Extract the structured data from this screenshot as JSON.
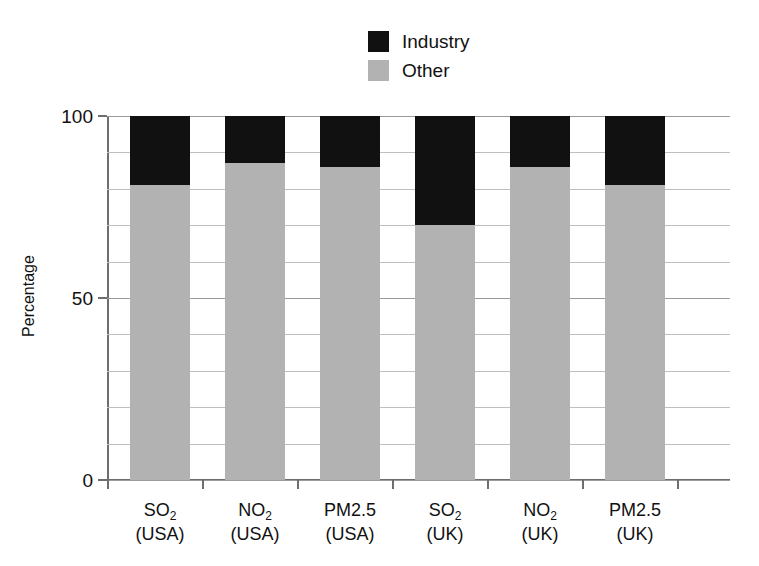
{
  "chart_data": {
    "type": "bar",
    "subtype": "stacked-100-percent",
    "title": "",
    "xlabel": "",
    "ylabel": "Percentage",
    "ylim": [
      0,
      100
    ],
    "yticks": [
      0,
      50,
      100
    ],
    "ytick_labels": [
      "0",
      "50",
      "100"
    ],
    "gridlines": [
      0,
      10,
      20,
      30,
      40,
      50,
      60,
      70,
      80,
      90,
      100
    ],
    "grid": true,
    "legend_position": "top-center",
    "categories": [
      "SO2 (USA)",
      "NO2 (USA)",
      "PM2.5 (USA)",
      "SO2 (UK)",
      "NO2 (UK)",
      "PM2.5 (UK)"
    ],
    "category_labels": [
      {
        "pollutant": "SO",
        "sub": "2",
        "region": "(USA)"
      },
      {
        "pollutant": "NO",
        "sub": "2",
        "region": "(USA)"
      },
      {
        "pollutant": "PM2.5",
        "sub": "",
        "region": "(USA)"
      },
      {
        "pollutant": "SO",
        "sub": "2",
        "region": "(UK)"
      },
      {
        "pollutant": "NO",
        "sub": "2",
        "region": "(UK)"
      },
      {
        "pollutant": "PM2.5",
        "sub": "",
        "region": "(UK)"
      }
    ],
    "series": [
      {
        "name": "Industry",
        "color": "#111111",
        "values": [
          19,
          13,
          14,
          30,
          14,
          19
        ]
      },
      {
        "name": "Other",
        "color": "#b2b2b2",
        "values": [
          81,
          87,
          86,
          70,
          86,
          81
        ]
      }
    ]
  },
  "legend": {
    "items": [
      {
        "label": "Industry",
        "color": "#111111"
      },
      {
        "label": "Other",
        "color": "#b2b2b2"
      }
    ]
  },
  "axis": {
    "y_title": "Percentage",
    "y_tick_labels": [
      "100",
      "50",
      "0"
    ]
  },
  "colors": {
    "industry": "#111111",
    "other": "#b2b2b2",
    "grid": "#bfbfbf",
    "axis": "#6e6e6e",
    "background": "#ffffff",
    "text": "#111111"
  }
}
